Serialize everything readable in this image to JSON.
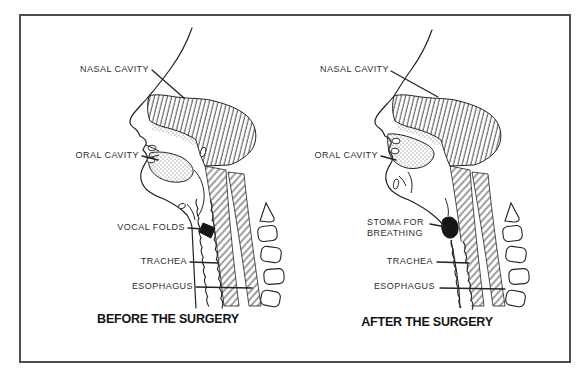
{
  "colors": {
    "frame": "#4f4f4f",
    "ink": "#232323",
    "label_text": "#2e2e2e",
    "caption_text": "#141414",
    "background": "#ffffff"
  },
  "figures": [
    {
      "caption": "BEFORE THE SURGERY",
      "labels": {
        "nasal": "NASAL CAVITY",
        "oral": "ORAL CAVITY",
        "vocal_folds": "VOCAL FOLDS",
        "trachea": "TRACHEA",
        "esophagus": "ESOPHAGUS"
      }
    },
    {
      "caption": "AFTER THE SURGERY",
      "labels": {
        "nasal": "NASAL CAVITY",
        "oral": "ORAL CAVITY",
        "stoma": [
          "STOMA FOR",
          "BREATHING"
        ],
        "trachea": "TRACHEA",
        "esophagus": "ESOPHAGUS"
      }
    }
  ]
}
